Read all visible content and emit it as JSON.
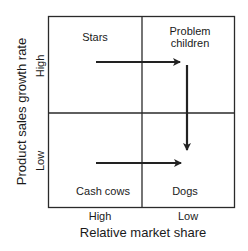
{
  "matrix": {
    "quadrants": {
      "top_left": "Stars",
      "top_right_line1": "Problem",
      "top_right_line2": "children",
      "bottom_left": "Cash cows",
      "bottom_right": "Dogs"
    },
    "y_axis": {
      "title": "Product sales growth rate",
      "high": "High",
      "low": "Low"
    },
    "x_axis": {
      "title": "Relative market share",
      "high": "High",
      "low": "Low"
    },
    "arrows": [
      {
        "from": "Stars",
        "to": "Problem children",
        "direction": "right"
      },
      {
        "from": "Problem children",
        "to": "Dogs",
        "direction": "down"
      },
      {
        "from": "Cash cows",
        "to": "Dogs",
        "direction": "right"
      }
    ],
    "colors": {
      "line": "#222222",
      "background": "#ffffff"
    }
  }
}
